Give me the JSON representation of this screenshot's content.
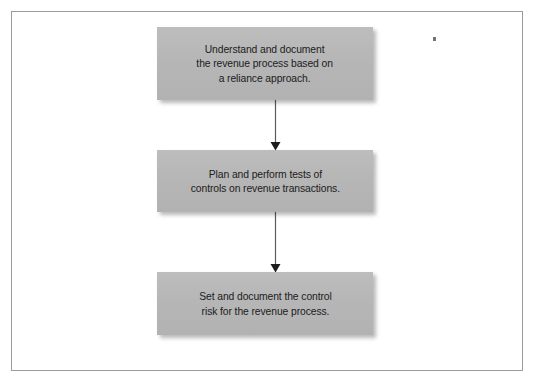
{
  "page": {
    "background_color": "#ffffff",
    "frame_border_color": "#9a9a9a"
  },
  "diagram": {
    "type": "flowchart",
    "orientation": "vertical",
    "node_fill_color": "#b7b7b7",
    "node_text_color": "#202020",
    "connector_color": "#555555",
    "nodes": [
      {
        "id": "node-1",
        "name": "understand-document-revenue-process",
        "text": "Understand and document\nthe revenue process based on\na reliance approach.",
        "line_1": "Understand and document",
        "line_2": "the revenue process based on",
        "line_3": "a reliance approach."
      },
      {
        "id": "node-2",
        "name": "plan-perform-tests-of-controls",
        "text": "Plan and perform tests of\ncontrols on revenue transactions.",
        "line_1": "Plan and perform tests of",
        "line_2": "controls on revenue transactions.",
        "line_3": ""
      },
      {
        "id": "node-3",
        "name": "set-document-control-risk",
        "text": "Set and document the control\nrisk for the revenue process.",
        "line_1": "Set and document the control",
        "line_2": "risk for the revenue process.",
        "line_3": ""
      }
    ],
    "connectors": [
      {
        "id": "arrow-1",
        "name": "arrow-node1-to-node2",
        "from": "node-1",
        "to": "node-2",
        "arrowhead": "filled-triangle-down"
      },
      {
        "id": "arrow-2",
        "name": "arrow-node2-to-node3",
        "from": "node-2",
        "to": "node-3",
        "arrowhead": "filled-triangle-down"
      }
    ],
    "artifacts": [
      {
        "id": "speck",
        "name": "scan-speck",
        "description": "small dark scan speck"
      }
    ]
  }
}
